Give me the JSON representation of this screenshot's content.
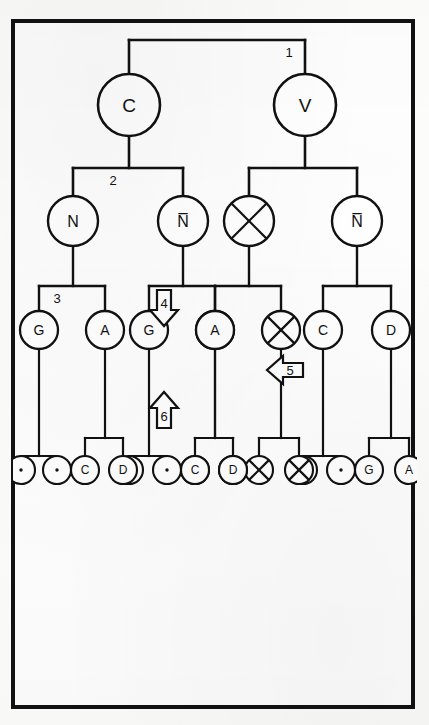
{
  "figure": {
    "orientation_degrees": 90,
    "frame_color": "#111111",
    "background_color": "#fefefe"
  },
  "nodes": {
    "root_v": {
      "label": "V",
      "style": "plain",
      "radius": 31
    },
    "root_c": {
      "label": "C",
      "style": "plain",
      "radius": 31
    },
    "v_child_nbar": {
      "label": "N̅",
      "style": "plain",
      "radius": 25
    },
    "v_child_x": {
      "label": "",
      "style": "crossed",
      "radius": 25
    },
    "c_child_nbar": {
      "label": "N̅",
      "style": "plain",
      "radius": 25
    },
    "c_child_n": {
      "label": "N",
      "style": "plain",
      "radius": 25
    },
    "nbar_child_d": {
      "label": "D",
      "style": "plain",
      "radius": 19
    },
    "nbar_child_c": {
      "label": "C",
      "style": "plain",
      "radius": 19
    },
    "x_child_x1": {
      "label": "",
      "style": "crossed",
      "radius": 19
    },
    "x_child_x2": {
      "label": "",
      "style": "crossed",
      "radius": 19
    },
    "cn1_child_a": {
      "label": "A",
      "style": "plain",
      "radius": 19
    },
    "cn1_child_g": {
      "label": "G",
      "style": "plain",
      "radius": 19
    },
    "cn2_child_a": {
      "label": "A",
      "style": "plain",
      "radius": 19
    },
    "cn2_child_g": {
      "label": "G",
      "style": "plain",
      "radius": 19
    },
    "leaf_a": {
      "label": "A",
      "style": "plain",
      "radius": 14
    },
    "leaf_g": {
      "label": "G",
      "style": "plain",
      "radius": 14
    },
    "leaf_dot_1": {
      "label": ".",
      "style": "dot",
      "radius": 14
    },
    "leaf_dot_2": {
      "label": ".",
      "style": "dot",
      "radius": 14
    },
    "leaf_x1": {
      "label": "",
      "style": "crossed",
      "radius": 14
    },
    "leaf_x2": {
      "label": "",
      "style": "crossed",
      "radius": 14
    },
    "leaf_x3": {
      "label": "",
      "style": "crossed",
      "radius": 14
    },
    "leaf_x4": {
      "label": "",
      "style": "crossed",
      "radius": 14
    },
    "leaf_d1": {
      "label": "D",
      "style": "plain",
      "radius": 14
    },
    "leaf_c1": {
      "label": "C",
      "style": "plain",
      "radius": 14
    },
    "leaf_dot_3": {
      "label": ".",
      "style": "dot",
      "radius": 14
    },
    "leaf_dot_4": {
      "label": ".",
      "style": "dot",
      "radius": 14
    },
    "leaf_d2": {
      "label": "D",
      "style": "plain",
      "radius": 14
    },
    "leaf_c2": {
      "label": "C",
      "style": "plain",
      "radius": 14
    },
    "leaf_dot_5": {
      "label": ".",
      "style": "dot",
      "radius": 14
    },
    "leaf_dot_6": {
      "label": ".",
      "style": "dot",
      "radius": 14
    }
  },
  "branch_labels": {
    "label_1": "1",
    "label_2": "2",
    "label_3a": "3",
    "label_3b": "3"
  },
  "arrows": [
    {
      "id": "arrow-4",
      "label": "4",
      "direction": "up"
    },
    {
      "id": "arrow-5",
      "label": "5",
      "direction": "right"
    },
    {
      "id": "arrow-6",
      "label": "6",
      "direction": "down"
    }
  ]
}
